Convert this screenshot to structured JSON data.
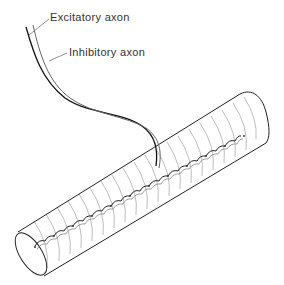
{
  "diagram": {
    "labels": {
      "excitatory": "Excitatory axon",
      "inhibitory": "Inhibitory axon"
    },
    "components": [
      {
        "id": "excitatory-axon",
        "label": "Excitatory axon",
        "stroke": "#111111"
      },
      {
        "id": "inhibitory-axon",
        "label": "Inhibitory axon",
        "stroke": "#666666"
      },
      {
        "id": "muscle-fiber",
        "shape": "striated cylinder"
      },
      {
        "id": "nerve-terminals",
        "shape": "scalloped varicosities along fiber"
      }
    ],
    "colors": {
      "background": "#ffffff",
      "outline": "#222222",
      "striations": "#9a9a9a",
      "text": "#333333"
    }
  }
}
